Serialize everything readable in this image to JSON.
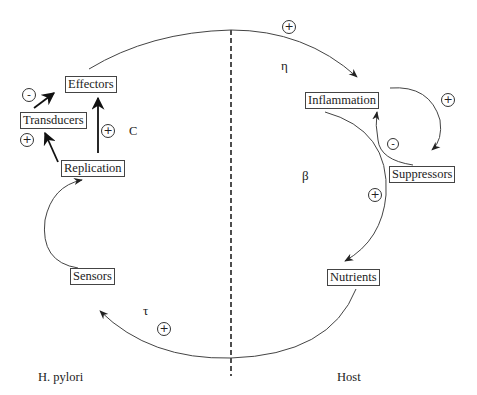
{
  "diagram": {
    "type": "feedback-loop-diagram",
    "regions": {
      "left": "H. pylori",
      "right": "Host"
    },
    "nodes": {
      "effectors": "Effectors",
      "transducers": "Transducers",
      "replication": "Replication",
      "sensors": "Sensors",
      "inflammation": "Inflammation",
      "suppressors": "Suppressors",
      "nutrients": "Nutrients"
    },
    "parameters": {
      "eta": "η",
      "beta": "β",
      "tau": "τ",
      "c": "C"
    },
    "signs": {
      "effectors_to_host": "+",
      "transducers_to_effectors": "-",
      "replication_to_transducers": "+",
      "replication_to_effectors": "+",
      "inflammation_to_suppressors": "+",
      "suppressors_to_inflammation": "-",
      "inflammation_to_nutrients": "+",
      "host_to_sensors": "+"
    },
    "edges": [
      {
        "from": "Effectors",
        "to": "Inflammation",
        "sign": "+",
        "label": "η"
      },
      {
        "from": "Transducers",
        "to": "Effectors",
        "sign": "-"
      },
      {
        "from": "Replication",
        "to": "Transducers",
        "sign": "+"
      },
      {
        "from": "Replication",
        "to": "Effectors",
        "sign": "+",
        "label": "C"
      },
      {
        "from": "Sensors",
        "to": "Replication",
        "sign": ""
      },
      {
        "from": "Inflammation",
        "to": "Suppressors",
        "sign": "+"
      },
      {
        "from": "Suppressors",
        "to": "Inflammation",
        "sign": "-"
      },
      {
        "from": "Inflammation",
        "to": "Nutrients",
        "sign": "+",
        "label": "β"
      },
      {
        "from": "Nutrients",
        "to": "Sensors",
        "sign": "+",
        "label": "τ"
      }
    ]
  }
}
